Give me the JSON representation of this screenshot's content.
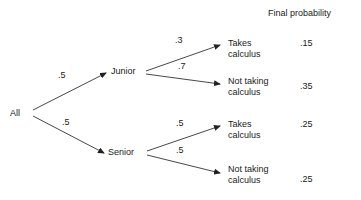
{
  "diagram": {
    "type": "probability-tree",
    "header": "Final probability",
    "root": {
      "label": "All"
    },
    "level1": [
      {
        "label": "Junior",
        "edge_probability": ".5"
      },
      {
        "label": "Senior",
        "edge_probability": ".5"
      }
    ],
    "leaves": [
      {
        "line1": "Takes",
        "line2": "calculus",
        "edge_probability": ".3",
        "final_probability": ".15",
        "parent": "Junior"
      },
      {
        "line1": "Not taking",
        "line2": "calculus",
        "edge_probability": ".7",
        "final_probability": ".35",
        "parent": "Junior"
      },
      {
        "line1": "Takes",
        "line2": "calculus",
        "edge_probability": ".5",
        "final_probability": ".25",
        "parent": "Senior"
      },
      {
        "line1": "Not taking",
        "line2": "calculus",
        "edge_probability": ".5",
        "final_probability": ".25",
        "parent": "Senior"
      }
    ],
    "colors": {
      "background": "#ffffff",
      "text": "#1a1a1a",
      "line": "#333333"
    }
  }
}
